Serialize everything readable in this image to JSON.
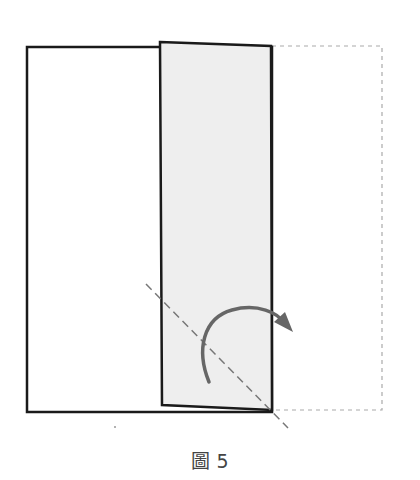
{
  "figure": {
    "caption": "圖 5",
    "colors": {
      "outline": "#1a1a1a",
      "flap_fill": "#eeeeee",
      "dashed_guide": "#aaaaaa",
      "fold_line": "#777777",
      "arrow": "#666666"
    },
    "elements": {
      "base_rect": {
        "x1": 27,
        "y1": 47,
        "x2": 272,
        "y2": 412
      },
      "folded_flap": [
        [
          160,
          42
        ],
        [
          271,
          46
        ],
        [
          272,
          410
        ],
        [
          162,
          405
        ]
      ],
      "ghost_rect": {
        "x1": 272,
        "y1": 46,
        "x2": 382,
        "y2": 410
      },
      "fold_line": {
        "x1": 146,
        "y1": 284,
        "x2": 288,
        "y2": 428
      },
      "arrow_arc": {
        "start": [
          209,
          382
        ],
        "end": [
          292,
          330
        ]
      }
    }
  }
}
